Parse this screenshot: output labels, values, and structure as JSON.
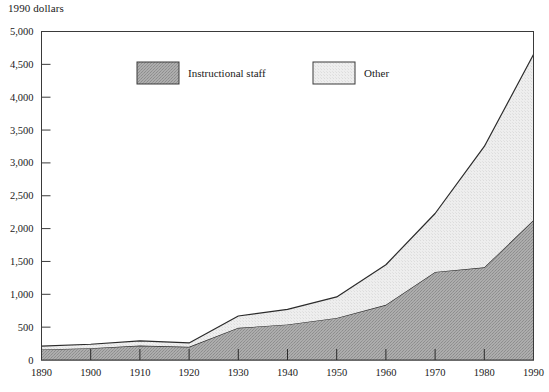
{
  "figure": {
    "unit_label": "1990 dollars"
  },
  "chart_data": {
    "type": "area",
    "stacked": true,
    "title": "",
    "subtitle": "",
    "xlabel": "",
    "ylabel": "1990 dollars",
    "x": [
      1890,
      1900,
      1910,
      1920,
      1930,
      1940,
      1950,
      1960,
      1970,
      1980,
      1990
    ],
    "categories": [
      "1890",
      "1900",
      "1910",
      "1920",
      "1930",
      "1940",
      "1950",
      "1960",
      "1970",
      "1980",
      "1990"
    ],
    "series": [
      {
        "name": "Instructional staff",
        "values": [
          160,
          180,
          220,
          200,
          490,
          540,
          640,
          840,
          1340,
          1410,
          2130
        ],
        "fill": "#a8a8a8",
        "pattern": "dark-stipple"
      },
      {
        "name": "Other",
        "values": [
          50,
          60,
          70,
          60,
          180,
          230,
          320,
          610,
          890,
          1840,
          2520
        ],
        "fill": "#ececec",
        "pattern": "light-stipple"
      }
    ],
    "totals": [
      210,
      240,
      290,
      260,
      670,
      770,
      960,
      1450,
      2230,
      3250,
      4650
    ],
    "xlim": [
      1890,
      1990
    ],
    "ylim": [
      0,
      5000
    ],
    "ytick_values": [
      0,
      500,
      1000,
      1500,
      2000,
      2500,
      3000,
      3500,
      4000,
      4500,
      5000
    ],
    "ytick_labels": [
      "0",
      "500",
      "1,000",
      "1,500",
      "2,000",
      "2,500",
      "3,000",
      "3,500",
      "4,000",
      "4,500",
      "5,000"
    ],
    "xtick_labels": [
      "1890",
      "1900",
      "1910",
      "1920",
      "1930",
      "1940",
      "1950",
      "1960",
      "1970",
      "1980",
      "1990"
    ],
    "grid": false,
    "legend_position": "top-inside",
    "legend": [
      "Instructional staff",
      "Other"
    ]
  }
}
